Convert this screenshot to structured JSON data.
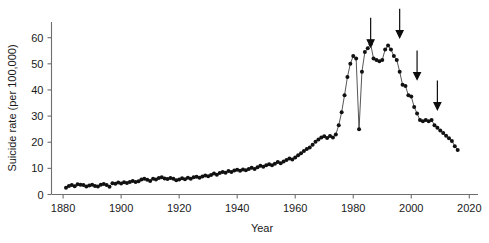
{
  "chart_data": {
    "type": "line",
    "title": "",
    "xlabel": "Year",
    "ylabel": "Suicide rate (per 100,000)",
    "xlim": [
      1876,
      2023
    ],
    "ylim": [
      0,
      66
    ],
    "xticks": [
      1880,
      1900,
      1920,
      1940,
      1960,
      1980,
      2000,
      2020
    ],
    "yticks": [
      0,
      10,
      20,
      30,
      40,
      50,
      60
    ],
    "grid": false,
    "legend": null,
    "marker": "filled-circle",
    "x": [
      1881,
      1882,
      1883,
      1884,
      1885,
      1886,
      1887,
      1888,
      1889,
      1890,
      1891,
      1892,
      1893,
      1894,
      1895,
      1896,
      1897,
      1898,
      1899,
      1900,
      1901,
      1902,
      1903,
      1904,
      1905,
      1906,
      1907,
      1908,
      1909,
      1910,
      1911,
      1912,
      1913,
      1914,
      1915,
      1916,
      1917,
      1918,
      1919,
      1920,
      1921,
      1922,
      1923,
      1924,
      1925,
      1926,
      1927,
      1928,
      1929,
      1930,
      1931,
      1932,
      1933,
      1934,
      1935,
      1936,
      1937,
      1938,
      1939,
      1940,
      1941,
      1942,
      1943,
      1944,
      1945,
      1946,
      1947,
      1948,
      1949,
      1950,
      1951,
      1952,
      1953,
      1954,
      1955,
      1956,
      1957,
      1958,
      1959,
      1960,
      1961,
      1962,
      1963,
      1964,
      1965,
      1966,
      1967,
      1968,
      1969,
      1970,
      1971,
      1972,
      1973,
      1974,
      1975,
      1976,
      1977,
      1978,
      1979,
      1980,
      1981,
      1982,
      1983,
      1984,
      1985,
      1986,
      1987,
      1988,
      1989,
      1990,
      1991,
      1992,
      1993,
      1994,
      1995,
      1996,
      1997,
      1998,
      1999,
      2000,
      2001,
      2002,
      2003,
      2004,
      2005,
      2006,
      2007,
      2008,
      2009,
      2010,
      2011,
      2012,
      2013,
      2014,
      2015,
      2016
    ],
    "values": [
      2.6,
      3.3,
      3.6,
      3.2,
      3.9,
      3.7,
      3.6,
      3.1,
      3.4,
      3.7,
      3.3,
      3.1,
      3.7,
      4.0,
      3.6,
      3.0,
      4.3,
      4.1,
      4.6,
      4.2,
      4.7,
      4.4,
      4.8,
      5.2,
      4.8,
      5.1,
      5.7,
      6.0,
      5.6,
      5.2,
      6.0,
      5.7,
      6.3,
      6.6,
      6.1,
      5.9,
      6.3,
      6.0,
      5.5,
      5.7,
      6.2,
      5.8,
      6.4,
      6.0,
      6.6,
      6.8,
      6.4,
      6.9,
      7.3,
      7.0,
      7.5,
      8.0,
      7.6,
      8.2,
      8.6,
      8.3,
      9.0,
      8.6,
      9.2,
      9.5,
      9.1,
      9.6,
      9.3,
      9.8,
      10.2,
      9.8,
      10.4,
      11.0,
      10.6,
      11.2,
      11.6,
      11.2,
      11.8,
      12.4,
      12.0,
      12.6,
      13.2,
      13.8,
      13.4,
      14.2,
      15.0,
      15.8,
      16.6,
      17.4,
      18.0,
      19.0,
      20.2,
      21.0,
      21.8,
      22.3,
      21.6,
      22.4,
      21.8,
      23.0,
      26.5,
      31.5,
      38.0,
      45.0,
      50.0,
      53.0,
      52.0,
      25.0,
      47.0,
      54.5,
      56.0,
      57.5,
      52.0,
      51.5,
      51.0,
      51.5,
      55.5,
      57.0,
      55.5,
      53.0,
      51.5,
      47.0,
      42.0,
      41.5,
      38.0,
      37.5,
      33.5,
      31.0,
      28.5,
      28.0,
      28.5,
      28.0,
      28.5,
      26.5,
      25.5,
      24.5,
      23.5,
      22.5,
      21.5,
      20.5,
      18.5,
      17.0
    ],
    "annotations": [
      {
        "name": "arrow-1",
        "x": 1986,
        "y_tip": 56.5,
        "label": ""
      },
      {
        "name": "arrow-2",
        "x": 1996,
        "y_tip": 60.0,
        "label": ""
      },
      {
        "name": "arrow-3",
        "x": 2002,
        "y_tip": 44.0,
        "label": ""
      },
      {
        "name": "arrow-4",
        "x": 2009,
        "y_tip": 32.5,
        "label": ""
      }
    ],
    "colors": {
      "line": "#2b2b2b",
      "marker": "#111111",
      "axis": "#6e6e6e",
      "arrow": "#0d0d0d",
      "background": "#ffffff"
    }
  }
}
